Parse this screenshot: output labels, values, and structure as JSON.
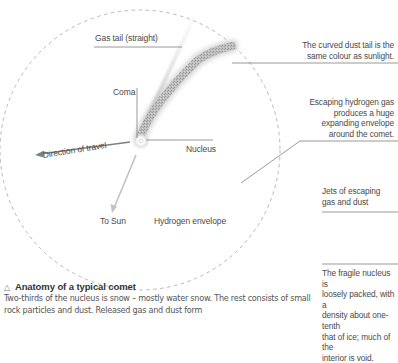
{
  "diagram": {
    "labels": {
      "gas_tail": "Gas tail (straight)",
      "coma": "Coma",
      "nucleus": "Nucleus",
      "direction_of_travel": "Direction of travel",
      "to_sun": "To Sun",
      "hydrogen_envelope": "Hydrogen envelope"
    },
    "notes": {
      "dust_tail": [
        "The curved dust tail is the",
        "same colour as sunlight."
      ],
      "hydrogen_gas": [
        "Escaping hydrogen gas",
        "produces a huge",
        "expanding envelope",
        "around the comet."
      ],
      "jets": [
        "Jets of escaping",
        "gas and dust"
      ],
      "fragile_nucleus": [
        "The fragile nucleus is",
        "loosely packed, with a",
        "density about one-tenth",
        "that of ice; much of the",
        "interior is void."
      ]
    },
    "colors": {
      "envelope_dash": "#b5b5b5",
      "leader_line": "#6e6e6e",
      "tail_gray": "#9a9a9a",
      "arrow_travel": "#7a7a7a",
      "arrow_sun": "#bdbdbd"
    }
  },
  "caption": {
    "icon": "triangle-icon",
    "title": "Anatomy of a typical comet",
    "body": "Two-thirds of the nucleus is snow – mostly water snow. The rest consists of small rock particles and dust. Released gas and dust form"
  }
}
